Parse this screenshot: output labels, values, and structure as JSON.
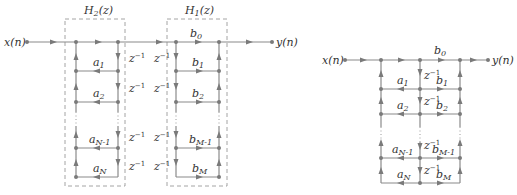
{
  "left_diagram": {
    "input_label": "x(n)",
    "output_label": "y(n)",
    "box_h2_label": "H2(z)",
    "box_h1_label": "H1(z)",
    "a_coeffs": [
      "a1",
      "a2",
      "aN-1",
      "aN"
    ],
    "b_coeffs": [
      "b0",
      "b1",
      "b2",
      "bM-1",
      "bM"
    ],
    "delay_label": "z^-1"
  },
  "right_diagram": {
    "input_label": "x(n)",
    "output_label": "y(n)",
    "a_coeffs": [
      "a1",
      "a2",
      "aN-1",
      "aN"
    ],
    "b_coeffs": [
      "b0",
      "b1",
      "b2",
      "bM-1",
      "bM"
    ],
    "delay_label": "z^-1"
  },
  "colors": {
    "line": "#8a8a8a",
    "text": "#333333"
  }
}
